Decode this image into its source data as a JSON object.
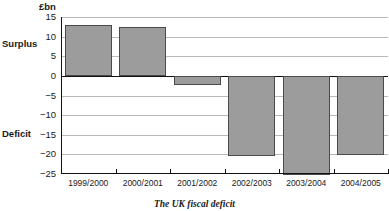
{
  "figure": {
    "unit_label": "£bn",
    "caption": "The UK fiscal deficit",
    "side_labels": {
      "surplus": "Surplus",
      "deficit": "Deficit"
    }
  },
  "chart_data": {
    "type": "bar",
    "title": "The UK fiscal deficit",
    "xlabel": "",
    "ylabel": "£bn",
    "ylim": [
      -25,
      15
    ],
    "yticks": [
      15,
      10,
      5,
      0,
      -5,
      -10,
      -15,
      -20,
      -25
    ],
    "ytick_labels": [
      "15",
      "10",
      "5",
      "0",
      "−5",
      "−10",
      "−15",
      "−20",
      "−25"
    ],
    "grid": true,
    "legend": "none",
    "categories": [
      "1999/2000",
      "2000/2001",
      "2001/2002",
      "2002/2003",
      "2003/2004",
      "2004/2005"
    ],
    "values": [
      13.0,
      12.4,
      -2.2,
      -20.3,
      -25.2,
      -20.2
    ],
    "series_name": "UK fiscal balance",
    "annotations": [
      "Surplus",
      "Deficit"
    ],
    "colors": {
      "bar_fill": "#9c9c9c",
      "bar_border": "#4a4a4a",
      "gridline": "#b9b9b9",
      "axis": "#111111",
      "background": "#ffffff"
    }
  }
}
